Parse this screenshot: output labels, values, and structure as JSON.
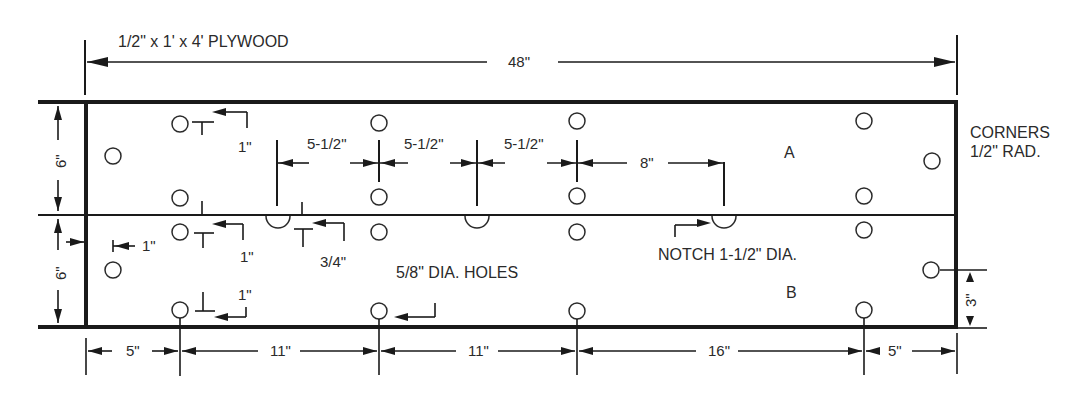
{
  "title": "1/2\" x 1' x 4' PLYWOOD",
  "overall_length": "48\"",
  "corners_note": {
    "line1": "CORNERS",
    "line2": "1/2\" RAD."
  },
  "panels": {
    "top": "A",
    "bottom": "B"
  },
  "heights": {
    "panel_a": "6\"",
    "panel_b": "6\"",
    "right_hole_offset": "3\""
  },
  "holes_note": "5/8\" DIA. HOLES",
  "notch_note": "NOTCH 1-1/2\" DIA.",
  "offsets": {
    "top_hole_from_edge": "1\"",
    "center_hole_from_divider": "1\"",
    "left_hole_from_end": "1\"",
    "notch_offset": "3/4\"",
    "bottom_hole_from_edge": "1\""
  },
  "notch_spacing": [
    "5-1/2\"",
    "5-1/2\"",
    "5-1/2\"",
    "8\""
  ],
  "bottom_dimensions": [
    "5\"",
    "11\"",
    "11\"",
    "16\"",
    "5\""
  ],
  "colors": {
    "line": "#1a1a1a",
    "text": "#2a2a2a",
    "background": "#ffffff"
  }
}
